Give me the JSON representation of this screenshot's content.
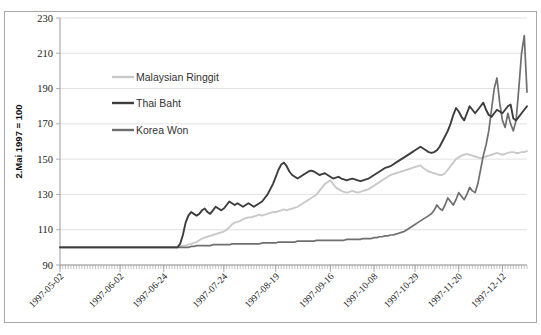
{
  "figure": {
    "title_partial": "",
    "background": "#ffffff",
    "frame_color": "#a8a8a8"
  },
  "chart_data": {
    "type": "line",
    "title": "",
    "subtitle": "",
    "xlabel": "",
    "ylabel": "2.Mai 1997 = 100",
    "ylim": [
      90,
      230
    ],
    "ytick_step": 20,
    "yticks": [
      90,
      110,
      130,
      150,
      170,
      190,
      210,
      230
    ],
    "ytick_labels": [
      "90",
      "110",
      "130",
      "150",
      "170",
      "190",
      "210",
      "230"
    ],
    "grid": true,
    "grid_axis": "y",
    "legend_position": "inside-upper-left",
    "xtick_labels": [
      "1997-05-02",
      "1997-06-02",
      "1997-06-24",
      "1997-07-24",
      "1997-08-19",
      "1997-09-16",
      "1997-10-08",
      "1997-10-29",
      "1997-11-20",
      "1997-12-12"
    ],
    "xtick_positions": [
      0,
      22,
      38,
      60,
      79,
      99,
      115,
      130,
      146,
      162
    ],
    "x_index_range": [
      0,
      171
    ],
    "x_minor_tick_count": 172,
    "colors": {
      "malaysian_ringgit": "#c9c9c9",
      "thai_baht": "#3d3d3d",
      "korea_won": "#6f6f6f"
    },
    "series": [
      {
        "name": "Malaysian Ringgit",
        "color": "#c9c9c9",
        "values": [
          100,
          100,
          100,
          100,
          100,
          100,
          100,
          100,
          100,
          100,
          100,
          100,
          100,
          100,
          100,
          100,
          100,
          100,
          100,
          100,
          100,
          100,
          100,
          100,
          100,
          100,
          100,
          100,
          100,
          100,
          100,
          100,
          100,
          100,
          100,
          100,
          100,
          100,
          100,
          100,
          100,
          100,
          100,
          100,
          100.5,
          101,
          101,
          101.5,
          102,
          102.5,
          103,
          104,
          105,
          105.5,
          106,
          106.5,
          107,
          107.5,
          108,
          108.5,
          109,
          110,
          111.5,
          113,
          114,
          114.5,
          115,
          116,
          116.5,
          117,
          117,
          117.5,
          118,
          118.5,
          118,
          118.5,
          119,
          119.5,
          120,
          120,
          120.5,
          121,
          121.5,
          121,
          121.5,
          122,
          122.5,
          123,
          124,
          125,
          126,
          127,
          128,
          129,
          130,
          132,
          134,
          136,
          137,
          138,
          136,
          134,
          133,
          132,
          131.5,
          131,
          131.5,
          132,
          131.5,
          131,
          131.5,
          132,
          132.5,
          133,
          134,
          135,
          136,
          137,
          138,
          139,
          140,
          141,
          141.5,
          142,
          142.5,
          143,
          143.5,
          144,
          144.5,
          145,
          145.5,
          146,
          146.5,
          145,
          144,
          143,
          142.5,
          142,
          141.5,
          141,
          141,
          142,
          144,
          146,
          148,
          150,
          151,
          152,
          152.5,
          153,
          152.5,
          152,
          151.5,
          151,
          150.5,
          151,
          151.5,
          152,
          152.5,
          153,
          153.5,
          153,
          152.5,
          153,
          153.5,
          154,
          154,
          153.5,
          153.5,
          154,
          154,
          154.5
        ]
      },
      {
        "name": "Thai Baht",
        "color": "#3d3d3d",
        "values": [
          100,
          100,
          100,
          100,
          100,
          100,
          100,
          100,
          100,
          100,
          100,
          100,
          100,
          100,
          100,
          100,
          100,
          100,
          100,
          100,
          100,
          100,
          100,
          100,
          100,
          100,
          100,
          100,
          100,
          100,
          100,
          100,
          100,
          100,
          100,
          100,
          100,
          100,
          100,
          100,
          100,
          100,
          100,
          100,
          102,
          107,
          114,
          118,
          120,
          119,
          118,
          119,
          121,
          122,
          120,
          119,
          121,
          123,
          122,
          121,
          122,
          124,
          126,
          125,
          124,
          125,
          124,
          123,
          124,
          125,
          124,
          123,
          124,
          125,
          126,
          128,
          130,
          133,
          136,
          140,
          144,
          147,
          148,
          146,
          143,
          141,
          140,
          139,
          140,
          141,
          142,
          143,
          143.5,
          143,
          142,
          141,
          141.5,
          142,
          141,
          140,
          139,
          139.5,
          140,
          139,
          138.5,
          138,
          138.5,
          139,
          138.5,
          138,
          137.5,
          138,
          138.5,
          139,
          140,
          141,
          142,
          143,
          144,
          145,
          145.5,
          146,
          147,
          148,
          149,
          150,
          151,
          152,
          153,
          154,
          155,
          156,
          157,
          156,
          155,
          154,
          153.5,
          154,
          155,
          157,
          160,
          163,
          166,
          170,
          175,
          179,
          177,
          174,
          172,
          176,
          180,
          178,
          176,
          178,
          180,
          182,
          178,
          175,
          174,
          176,
          178,
          177,
          176,
          178,
          180,
          181,
          173,
          172,
          174,
          176,
          178,
          180
        ]
      },
      {
        "name": "Korea Won",
        "color": "#6f6f6f",
        "values": [
          100,
          100,
          100,
          100,
          100,
          100,
          100,
          100,
          100,
          100,
          100,
          100,
          100,
          100,
          100,
          100,
          100,
          100,
          100,
          100,
          100,
          100,
          100,
          100,
          100,
          100,
          100,
          100,
          100,
          100,
          100,
          100,
          100,
          100,
          100,
          100,
          100,
          100,
          100,
          100,
          100,
          100,
          100,
          100,
          100,
          100,
          100,
          100,
          100.5,
          100.5,
          101,
          101,
          101,
          101,
          101,
          101,
          101.5,
          101.5,
          101.5,
          101.5,
          101.5,
          101.5,
          101.5,
          102,
          102,
          102,
          102,
          102,
          102,
          102,
          102,
          102,
          102,
          102,
          102.5,
          102.5,
          102.5,
          102.5,
          102.5,
          102.5,
          103,
          103,
          103,
          103,
          103,
          103,
          103,
          103.5,
          103.5,
          103.5,
          103.5,
          103.5,
          103.5,
          103.5,
          104,
          104,
          104,
          104,
          104,
          104,
          104,
          104,
          104,
          104,
          104,
          104.5,
          104.5,
          104.5,
          104.5,
          104.5,
          104.5,
          105,
          105,
          105,
          105,
          105.5,
          105.5,
          106,
          106,
          106.5,
          106.5,
          107,
          107,
          107.5,
          108,
          108.5,
          109,
          110,
          111,
          112,
          113,
          114,
          115,
          116,
          117,
          118,
          119,
          121,
          124,
          122,
          121,
          124,
          128,
          126,
          124,
          127,
          131,
          129,
          127,
          130,
          134,
          132,
          131,
          136,
          144,
          152,
          158,
          166,
          178,
          190,
          196,
          182,
          172,
          168,
          176,
          170,
          166,
          172,
          190,
          210,
          220,
          188
        ]
      }
    ]
  }
}
